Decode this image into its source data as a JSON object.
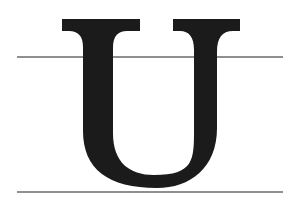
{
  "canvas": {
    "width": 294,
    "height": 201,
    "background_color": "#ffffff"
  },
  "specimen": {
    "character": "U",
    "character_name": "latin-capital-letter-u",
    "style": "serif-didone-high-contrast",
    "glyph_color": "#1b1b1b",
    "description": "Capital letter U with flat slab top serifs and rounded bowl"
  },
  "guides": {
    "color": "#8f8f8f",
    "thickness_px": 2,
    "lines": [
      {
        "name": "upper-guide-line",
        "label": "x-height guide",
        "y": 56,
        "x_start": 17,
        "x_end": 283
      },
      {
        "name": "lower-guide-line",
        "label": "baseline guide",
        "y": 191,
        "x_start": 17,
        "x_end": 283
      }
    ]
  },
  "glyph_geometry": {
    "cap_top_y": 19,
    "serif_bottom_y": 31,
    "bowl_bottom_y": 187,
    "left_serif_x_start": 62,
    "left_serif_x_end": 140,
    "right_serif_x_start": 173,
    "right_serif_x_end": 240,
    "left_stem_outer_x": 83,
    "left_stem_inner_x": 112,
    "right_stem_inner_x": 196,
    "right_stem_outer_x": 217,
    "counter_left_x": 111,
    "counter_right_x": 196
  }
}
